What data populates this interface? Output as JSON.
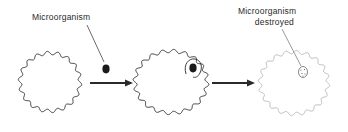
{
  "diagram": {
    "type": "phagocytosis-sequence",
    "stages": [
      {
        "name": "cell-before",
        "label": ""
      },
      {
        "name": "cell-engulfing",
        "label": ""
      },
      {
        "name": "cell-after",
        "label": ""
      }
    ],
    "labels": {
      "microorganism": "Microorganism",
      "destroyed_line1": "Microorganism",
      "destroyed_line2": "destroyed"
    },
    "colors": {
      "ink": "#2a2a2a",
      "background": "#ffffff"
    }
  }
}
